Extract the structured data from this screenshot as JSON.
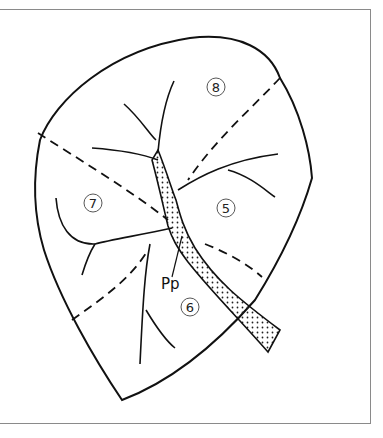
{
  "figure": {
    "type": "anatomical-line-drawing",
    "colors": {
      "outline": "#111111",
      "frame": "#8a8a8a",
      "stipple": "#222222",
      "background": "#ffffff"
    }
  },
  "labels": {
    "segments": [
      {
        "id": "8",
        "text": "8",
        "x": 216,
        "y": 87
      },
      {
        "id": "7",
        "text": "7",
        "x": 93,
        "y": 203
      },
      {
        "id": "5",
        "text": "5",
        "x": 226,
        "y": 208
      },
      {
        "id": "6",
        "text": "6",
        "x": 190,
        "y": 307
      }
    ],
    "pointer": {
      "text": "Pp",
      "x": 161,
      "y": 289
    }
  }
}
